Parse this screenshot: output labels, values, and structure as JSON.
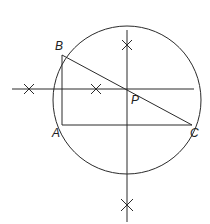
{
  "diagram": {
    "stroke_color": "#2a2a2a",
    "circle": {
      "cx": 127,
      "cy": 100,
      "r": 74
    },
    "points": {
      "A": {
        "label": "A",
        "x": 62,
        "y": 125
      },
      "B": {
        "label": "B",
        "x": 62,
        "y": 55
      },
      "C": {
        "label": "C",
        "x": 192,
        "y": 125
      },
      "P": {
        "label": "P",
        "x": 127,
        "y": 89
      }
    },
    "labels": {
      "A": "A",
      "B": "B",
      "C": "C",
      "P": "P"
    },
    "segments": [
      {
        "name": "AB",
        "from": "A",
        "to": "B"
      },
      {
        "name": "AC",
        "from": "A",
        "to": "C"
      },
      {
        "name": "BC",
        "from": "B",
        "to": "C"
      }
    ],
    "bisectors": {
      "horizontal": {
        "x1": 12,
        "y1": 89,
        "x2": 194,
        "y2": 89
      },
      "vertical": {
        "x1": 127,
        "y1": 30,
        "x2": 127,
        "y2": 222
      }
    },
    "arc_marks": [
      {
        "x": 29,
        "y": 89
      },
      {
        "x": 96,
        "y": 89
      },
      {
        "x": 127,
        "y": 45
      },
      {
        "x": 127,
        "y": 205
      }
    ]
  }
}
